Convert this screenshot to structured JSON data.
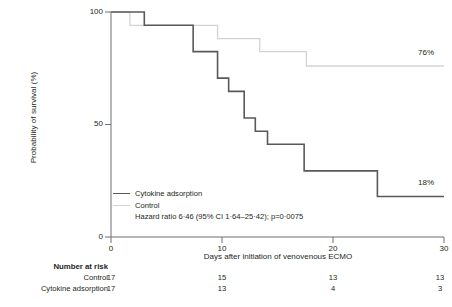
{
  "chart_data": {
    "type": "line",
    "subtype": "kaplan-meier-step",
    "title": "",
    "xlabel": "Days after initiation of venovenous ECMO",
    "ylabel": "Probability of survival (%)",
    "xlim": [
      0,
      30
    ],
    "ylim": [
      0,
      100
    ],
    "xticks": [
      0,
      10,
      20,
      30
    ],
    "yticks": [
      0,
      50,
      100
    ],
    "xtick_labels": [
      "0",
      "10",
      "20",
      "30"
    ],
    "ytick_labels": [
      "0",
      "50",
      "100"
    ],
    "grid": false,
    "legend_position": "lower-left-inside",
    "series": [
      {
        "name": "Cytokine adsorption",
        "color": "#58595b",
        "line_width": 1.6,
        "final_value_label": "18%",
        "final_value": 18,
        "steps": [
          {
            "x": 0,
            "y": 100
          },
          {
            "x": 3.0,
            "y": 100
          },
          {
            "x": 3.0,
            "y": 94.1
          },
          {
            "x": 7.4,
            "y": 94.1
          },
          {
            "x": 7.4,
            "y": 82.4
          },
          {
            "x": 9.6,
            "y": 82.4
          },
          {
            "x": 9.6,
            "y": 70.6
          },
          {
            "x": 10.6,
            "y": 70.6
          },
          {
            "x": 10.6,
            "y": 64.7
          },
          {
            "x": 12.0,
            "y": 64.7
          },
          {
            "x": 12.0,
            "y": 52.9
          },
          {
            "x": 13.0,
            "y": 52.9
          },
          {
            "x": 13.0,
            "y": 47.0
          },
          {
            "x": 14.1,
            "y": 47.0
          },
          {
            "x": 14.1,
            "y": 41.2
          },
          {
            "x": 17.4,
            "y": 41.2
          },
          {
            "x": 17.4,
            "y": 29.4
          },
          {
            "x": 24.0,
            "y": 29.4
          },
          {
            "x": 24.0,
            "y": 18.0
          },
          {
            "x": 30,
            "y": 18.0
          }
        ]
      },
      {
        "name": "Control",
        "color": "#d2d3d5",
        "line_width": 1.3,
        "final_value_label": "76%",
        "final_value": 76,
        "steps": [
          {
            "x": 0,
            "y": 100
          },
          {
            "x": 1.7,
            "y": 100
          },
          {
            "x": 1.7,
            "y": 94.1
          },
          {
            "x": 9.6,
            "y": 94.1
          },
          {
            "x": 9.6,
            "y": 88.2
          },
          {
            "x": 13.4,
            "y": 88.2
          },
          {
            "x": 13.4,
            "y": 82.4
          },
          {
            "x": 17.6,
            "y": 82.4
          },
          {
            "x": 17.6,
            "y": 76.0
          },
          {
            "x": 30,
            "y": 76.0
          }
        ]
      }
    ],
    "annotations": [
      {
        "text": "Hazard ratio 6·46 (95% CI 1·64–25·42); p=0·0075",
        "position": "legend"
      }
    ],
    "number_at_risk": {
      "title": "Number at risk",
      "time_points": [
        0,
        10,
        20,
        30
      ],
      "rows": [
        {
          "label": "Control",
          "values": [
            "17",
            "15",
            "13",
            "13"
          ]
        },
        {
          "label": "Cytokine adsorption",
          "values": [
            "17",
            "13",
            "4",
            "3"
          ]
        }
      ]
    }
  },
  "legend": {
    "entries": [
      {
        "label": "Cytokine adsorption",
        "swatch": "dark"
      },
      {
        "label": "Control",
        "swatch": "light"
      },
      {
        "label": "Hazard ratio 6·46 (95% CI 1·64–25·42); p=0·0075",
        "swatch": "blank"
      }
    ]
  },
  "colors": {
    "cytokine_adsorption": "#58595b",
    "control": "#d2d3d5",
    "axis": "#6d6e71",
    "text": "#231f20"
  }
}
